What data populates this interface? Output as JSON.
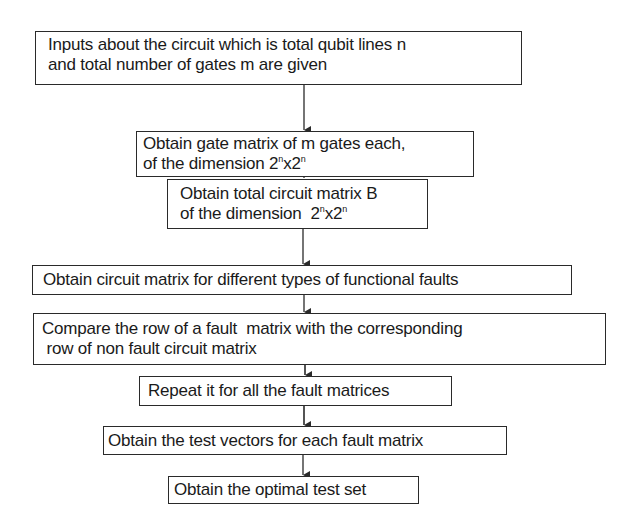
{
  "diagram": {
    "type": "flowchart",
    "direction": "top-to-bottom",
    "colors": {
      "background": "#ffffff",
      "stroke": "#2a2a2a",
      "text": "#1a1a1a"
    },
    "steps": [
      {
        "id": "inputs",
        "lines": [
          "Inputs  about the circuit which is total qubit lines n",
          "and total number of gates m  are given"
        ]
      },
      {
        "id": "gate-matrix",
        "lines": [
          "Obtain gate matrix of m gates each,",
          "of the dimension "
        ],
        "dimension": {
          "base": "2",
          "exp": "n",
          "times": "x"
        }
      },
      {
        "id": "total-circuit-matrix",
        "lines": [
          "Obtain total circuit matrix B",
          "of the dimension  "
        ],
        "dimension": {
          "base": "2",
          "exp": "n",
          "times": "x"
        }
      },
      {
        "id": "fault-circuit-matrices",
        "lines": [
          "Obtain circuit matrix for different types of functional faults"
        ]
      },
      {
        "id": "compare-rows",
        "lines": [
          "Compare the row of a fault  matrix with the corresponding",
          " row of non fault circuit matrix"
        ]
      },
      {
        "id": "repeat",
        "lines": [
          "Repeat it for all the fault matrices"
        ]
      },
      {
        "id": "test-vectors",
        "lines": [
          "Obtain the test vectors for each fault matrix"
        ]
      },
      {
        "id": "optimal-test-set",
        "lines": [
          "Obtain the optimal test set"
        ]
      }
    ],
    "edges": [
      {
        "from": "inputs",
        "to": "gate-matrix"
      },
      {
        "from": "gate-matrix",
        "to": "total-circuit-matrix"
      },
      {
        "from": "total-circuit-matrix",
        "to": "fault-circuit-matrices"
      },
      {
        "from": "fault-circuit-matrices",
        "to": "compare-rows"
      },
      {
        "from": "compare-rows",
        "to": "repeat"
      },
      {
        "from": "repeat",
        "to": "test-vectors"
      },
      {
        "from": "test-vectors",
        "to": "optimal-test-set"
      }
    ]
  }
}
